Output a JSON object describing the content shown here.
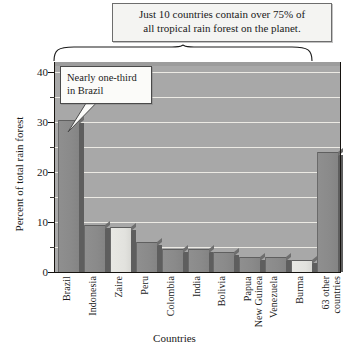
{
  "chart_data": {
    "type": "bar",
    "title": "Just 10 countries contain over 75% of all tropical rain forest on the planet.",
    "title_lines": [
      "Just 10 countries contain over 75% of",
      "all tropical rain forest on the planet."
    ],
    "xlabel": "Countries",
    "ylabel": "Percent of total rain forest",
    "ylim": [
      0,
      42
    ],
    "yticks_major": [
      0,
      10,
      20,
      30,
      40
    ],
    "ytick_labels": [
      "0",
      "10",
      "20",
      "30",
      "40"
    ],
    "yticks_minor": [
      5,
      15,
      25,
      35
    ],
    "grid": true,
    "grid_values": [
      5,
      10,
      15,
      20,
      25,
      30,
      35,
      40
    ],
    "legend": "none",
    "categories": [
      "Brazil",
      "Indonesia",
      "Zaire",
      "Peru",
      "Colombia",
      "India",
      "Bolivia",
      "Papua\nNew Guinea",
      "Venezuela",
      "Burma",
      "63 other\ncountries"
    ],
    "values": [
      30.5,
      9.4,
      9.0,
      6.0,
      4.6,
      4.6,
      4.0,
      3.0,
      3.0,
      2.5,
      24.0
    ],
    "bar_styles": [
      "dark",
      "dark",
      "light",
      "dark",
      "dark",
      "dark",
      "dark",
      "dark",
      "dark",
      "light",
      "dark"
    ],
    "annotations": [
      {
        "name": "brazil-callout",
        "text": "Nearly one-third in Brazil",
        "lines": [
          "Nearly one-third",
          "in Brazil"
        ],
        "points_to": "Brazil"
      },
      {
        "name": "top-brace",
        "text": "",
        "spans": "Brazil through Burma"
      }
    ],
    "colors": {
      "plot_background": "#a8a8a8",
      "bar_dark": "#8c8c8c",
      "bar_light": "#e8e8e4",
      "bar_side": "#5e5e5e",
      "gridline": "#eceae4",
      "axis": "#16130f",
      "callout_background": "#fbfbf9",
      "title_background": "#f4f4f2"
    }
  }
}
